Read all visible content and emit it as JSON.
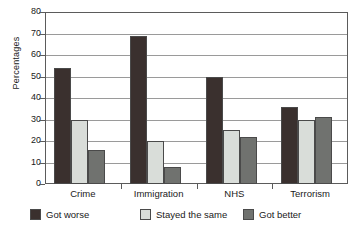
{
  "chart_data": {
    "type": "bar",
    "title": "",
    "subtitle": "",
    "xlabel": "",
    "ylabel": "Percentages",
    "ylim": [
      0,
      80
    ],
    "ytick_step": 10,
    "yticks": [
      80,
      70,
      60,
      50,
      40,
      30,
      20,
      10,
      0
    ],
    "grid": true,
    "grid_axis": "y",
    "legend_position": "bottom",
    "categories": [
      "Crime",
      "Immigration",
      "NHS",
      "Terrorism"
    ],
    "series": [
      {
        "name": "Got worse",
        "color": "#3a302e",
        "values": [
          54,
          69,
          50,
          36
        ]
      },
      {
        "name": "Stayed the same",
        "color": "#d9ddd9",
        "values": [
          30,
          20,
          25,
          30
        ]
      },
      {
        "name": "Got better",
        "color": "#70726f",
        "values": [
          16,
          8,
          22,
          31
        ]
      }
    ]
  },
  "axis": {
    "y_title": "Percentages"
  },
  "colors": {
    "got_worse": "#3a302e",
    "stayed_the_same": "#d9ddd9",
    "got_better": "#70726f",
    "axis_line": "#5b5b5b",
    "gridline": "#9a9a9a",
    "bar_outline": "#4a4a4a",
    "background": "#ffffff",
    "text": "#1a1a1a"
  }
}
